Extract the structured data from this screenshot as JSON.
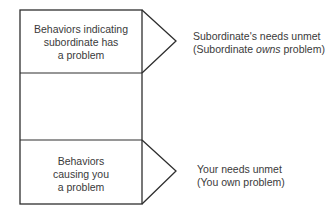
{
  "diagram": {
    "top_box": {
      "label_lines": [
        "Behaviors indicating",
        "subordinate has",
        "a problem"
      ]
    },
    "bottom_box": {
      "label_lines": [
        "Behaviors",
        "causing you",
        "a problem"
      ]
    },
    "top_outcome": {
      "line1": "Subordinate's needs unmet",
      "line2_prefix": "(Subordinate ",
      "line2_emphasis": "owns",
      "line2_suffix": " problem)"
    },
    "bottom_outcome": {
      "line1": "Your needs unmet",
      "line2_prefix": "(You ",
      "line2_emphasis": "own",
      "line2_suffix": " problem)"
    },
    "colors": {
      "stroke": "#2e2e2e",
      "text": "#3a3a3a",
      "background": "#ffffff"
    }
  }
}
